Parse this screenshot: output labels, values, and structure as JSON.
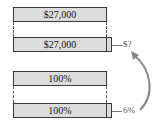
{
  "diagram": {
    "top_group": {
      "original_box": {
        "label": "$27,000"
      },
      "increased_box": {
        "label": "$27,000"
      },
      "increase_label": "$?"
    },
    "bottom_group": {
      "original_box": {
        "label": "100%"
      },
      "increased_box": {
        "label": "100%"
      },
      "increase_label": "6%"
    }
  }
}
